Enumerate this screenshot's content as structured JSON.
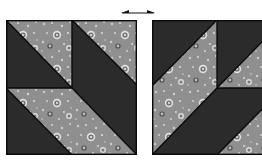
{
  "figure": {
    "colors": {
      "dark_fabric": "#2b2b2b",
      "print_fabric": "#8f8f8f",
      "print_light_dot": "#d9d9d9",
      "print_dark_ring": "#555555",
      "seam": "#0a0a0a",
      "background": "#ffffff"
    },
    "arrow": {
      "icon": "double-headed-arrow-icon",
      "direction": "left-right"
    },
    "blocks": [
      {
        "id": "left-block",
        "label": ""
      },
      {
        "id": "right-block",
        "label": ""
      }
    ]
  }
}
